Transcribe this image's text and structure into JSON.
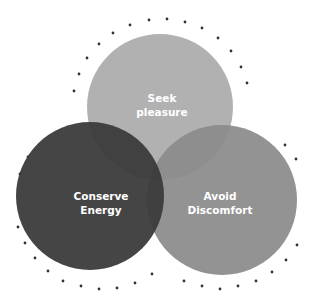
{
  "diagram": {
    "type": "venn",
    "circles": [
      {
        "id": "seek",
        "line1": "Seek",
        "line2": "pleasure",
        "color": "#b1b1b1"
      },
      {
        "id": "conserve",
        "line1": "Conserve",
        "line2": "Energy",
        "color": "#3b3b3b"
      },
      {
        "id": "avoid",
        "line1": "Avoid",
        "line2": "Discomfort",
        "color": "#8b8b8b"
      }
    ],
    "dot_color": "#333333"
  }
}
